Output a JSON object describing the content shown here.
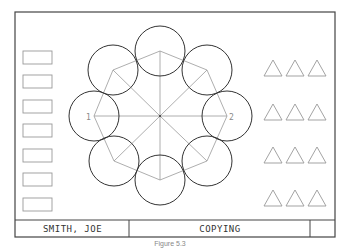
{
  "figure": {
    "frame": {
      "x": 15,
      "y": 12,
      "w": 320,
      "h": 225,
      "stroke": "#444444"
    },
    "center": {
      "x": 160,
      "y": 116
    },
    "circle_radius": 25,
    "circle_stroke": "#333333",
    "line_stroke": "#999999",
    "octagon_points": [
      {
        "x": 160,
        "y": 51
      },
      {
        "x": 207,
        "y": 70
      },
      {
        "x": 227,
        "y": 116
      },
      {
        "x": 207,
        "y": 161
      },
      {
        "x": 160,
        "y": 180
      },
      {
        "x": 114,
        "y": 161
      },
      {
        "x": 94,
        "y": 116
      },
      {
        "x": 113,
        "y": 70
      }
    ],
    "labels": {
      "left": "1",
      "right": "2"
    },
    "rectangles": {
      "x": 23,
      "w": 29,
      "h": 13,
      "ys": [
        51,
        75,
        100,
        124,
        149,
        173,
        198
      ]
    },
    "triangles": {
      "xs": [
        264,
        286,
        308
      ],
      "ys": [
        60,
        104,
        147,
        190
      ],
      "w": 18,
      "h": 16
    }
  },
  "title_block": {
    "name": "SMITH, JOE",
    "title": "COPYING",
    "extra": ""
  },
  "caption": "Figure 5.3"
}
